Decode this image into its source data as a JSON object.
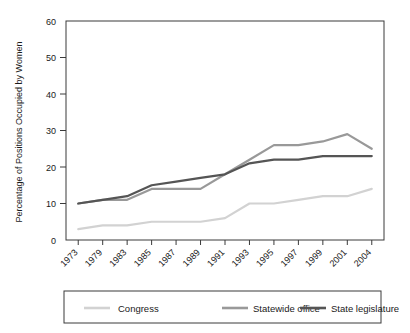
{
  "chart_data": {
    "type": "line",
    "title": "",
    "subtitle": "",
    "xlabel": "",
    "ylabel": "Percentage of Positions Occupied by Women",
    "categories": [
      "1973",
      "1979",
      "1983",
      "1985",
      "1987",
      "1989",
      "1991",
      "1993",
      "1995",
      "1997",
      "1999",
      "2001",
      "2004"
    ],
    "ylim": [
      0,
      60
    ],
    "yticks": [
      0,
      10,
      20,
      30,
      40,
      50,
      60
    ],
    "ytick_labels": [
      "0",
      "10",
      "20",
      "30",
      "40",
      "50",
      "60"
    ],
    "grid": false,
    "legend_position": "bottom",
    "series": [
      {
        "name": "Congress",
        "color": "#d2d2d2",
        "values": [
          3,
          4,
          4,
          5,
          5,
          5,
          6,
          10,
          10,
          11,
          12,
          12,
          14
        ]
      },
      {
        "name": "Statewide office",
        "color": "#999999",
        "values": [
          10,
          11,
          11,
          14,
          14,
          14,
          18,
          22,
          26,
          26,
          27,
          29,
          25
        ]
      },
      {
        "name": "State legislature",
        "color": "#555555",
        "values": [
          10,
          11,
          12,
          15,
          16,
          17,
          18,
          21,
          22,
          22,
          23,
          23,
          23
        ]
      }
    ]
  },
  "legend": {
    "items": [
      {
        "label": "Congress"
      },
      {
        "label": "Statewide office"
      },
      {
        "label": "State legislature"
      }
    ]
  }
}
